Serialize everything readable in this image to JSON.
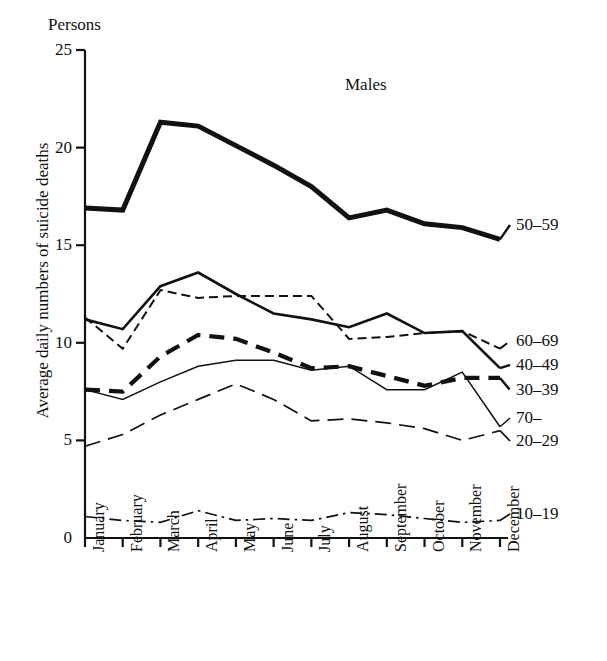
{
  "chart_data": {
    "type": "line",
    "title": "Males",
    "unit_label": "Persons",
    "ylabel": "Average daily numbers of suicide deaths",
    "xlabel": "",
    "ylim": [
      0,
      25
    ],
    "yticks": [
      0,
      5,
      10,
      15,
      20,
      25
    ],
    "grid": false,
    "legend_position": "right-inline",
    "categories": [
      "January",
      "February",
      "March",
      "April",
      "May",
      "June",
      "July",
      "August",
      "September",
      "October",
      "November",
      "December"
    ],
    "series": [
      {
        "name": "50-59",
        "label": "50–59",
        "style": "solid-thick",
        "width": 5.0,
        "dash": "",
        "label_value": 15.3,
        "values": [
          16.9,
          16.8,
          21.3,
          21.1,
          20.1,
          19.1,
          18.0,
          16.4,
          16.8,
          16.1,
          15.9,
          15.3
        ]
      },
      {
        "name": "40-49",
        "label": "40–49",
        "style": "solid-medium",
        "width": 2.6,
        "dash": "",
        "label_value": 8.7,
        "values": [
          11.2,
          10.7,
          12.9,
          13.6,
          12.5,
          11.5,
          11.2,
          10.8,
          11.5,
          10.5,
          10.6,
          8.7
        ]
      },
      {
        "name": "60-69",
        "label": "60–69",
        "style": "short-dash",
        "width": 2.0,
        "dash": "9,5",
        "label_value": 9.7,
        "values": [
          11.3,
          9.7,
          12.7,
          12.3,
          12.4,
          12.4,
          12.4,
          10.2,
          10.3,
          10.5,
          10.6,
          9.7
        ]
      },
      {
        "name": "30-39",
        "label": "30–39",
        "style": "thick-dash",
        "width": 4.2,
        "dash": "15,9",
        "label_value": 8.2,
        "values": [
          7.6,
          7.5,
          9.3,
          10.4,
          10.2,
          9.5,
          8.7,
          8.8,
          8.3,
          7.8,
          8.2,
          8.2
        ]
      },
      {
        "name": "70-",
        "label": "70–",
        "style": "solid-thin",
        "width": 1.5,
        "dash": "",
        "label_value": 5.7,
        "values": [
          7.6,
          7.1,
          8.0,
          8.8,
          9.1,
          9.1,
          8.6,
          8.8,
          7.6,
          7.6,
          8.5,
          5.7
        ]
      },
      {
        "name": "20-29",
        "label": "20–29",
        "style": "long-dash",
        "width": 1.7,
        "dash": "16,8",
        "label_value": 5.5,
        "values": [
          4.7,
          5.3,
          6.3,
          7.1,
          7.9,
          7.1,
          6.0,
          6.1,
          5.9,
          5.6,
          5.0,
          5.5
        ]
      },
      {
        "name": "10-19",
        "label": "10–19",
        "style": "dash-dot",
        "width": 1.7,
        "dash": "12,5,2.5,5",
        "label_value": 0.9,
        "values": [
          1.1,
          0.9,
          0.8,
          1.4,
          0.9,
          1.0,
          0.9,
          1.3,
          1.2,
          1.0,
          0.8,
          0.9
        ]
      }
    ]
  }
}
